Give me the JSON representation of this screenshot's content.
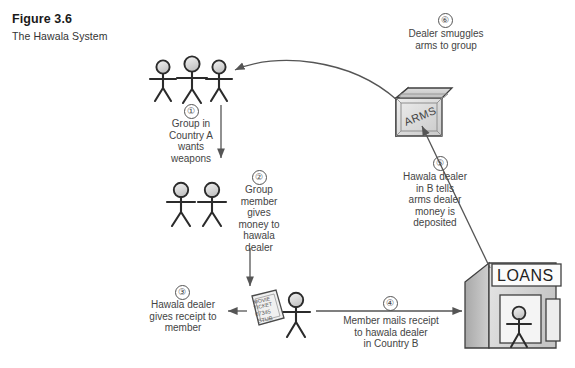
{
  "figure": {
    "number_label": "Figure 3.6",
    "title": "The Hawala System"
  },
  "steps": [
    {
      "id": "1",
      "marker": "①",
      "caption": "Group in\nCountry A\nwants\nweapons"
    },
    {
      "id": "2",
      "marker": "②",
      "caption": "Group\nmember\ngives\nmoney to\nhawala\ndealer"
    },
    {
      "id": "3",
      "marker": "③",
      "caption": "Hawala dealer\ngives receipt to\nmember"
    },
    {
      "id": "4",
      "marker": "④",
      "caption": "Member mails receipt\nto hawala dealer\nin Country B"
    },
    {
      "id": "5",
      "marker": "⑤",
      "caption": "Hawala dealer\nin B tells\narms dealer\nmoney is\ndeposited"
    },
    {
      "id": "6",
      "marker": "⑥",
      "caption": "Dealer smuggles\narms to group"
    }
  ],
  "objects": {
    "crate_label": "ARMS",
    "bank_label": "LOANS",
    "ticket": {
      "line1": "MOVIE",
      "line2": "TICKET",
      "line3": "07345",
      "line4": "STUB"
    }
  },
  "colors": {
    "ink": "#444444",
    "line": "#555555",
    "head_fill": "#d8d8d8",
    "box_fill": "#d5d5d5",
    "box_top": "#c8c8c8",
    "box_side": "#b4b4b4",
    "background": "#ffffff"
  }
}
